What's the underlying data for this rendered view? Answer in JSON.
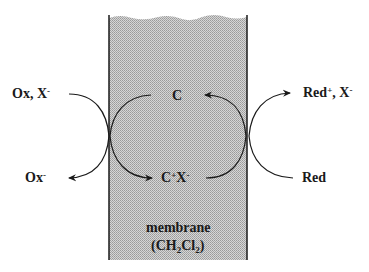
{
  "diagram": {
    "colors": {
      "membrane_fill": "#c8c8c8",
      "stroke": "#1a1a1a",
      "text": "#1a1a1a",
      "background": "#ffffff"
    },
    "left_side": {
      "top_species": {
        "main": "Ox, X",
        "charge": "-"
      },
      "bottom_species": {
        "main": "Ox",
        "charge": "-"
      }
    },
    "membrane": {
      "top_species": {
        "main": "C"
      },
      "bottom_species": {
        "main": "C",
        "charge1": "+",
        "mid": "X",
        "charge2": "-"
      },
      "label": "membrane",
      "solvent": {
        "open": "(CH",
        "sub1": "2",
        "mid": "Cl",
        "sub2": "2",
        "close": ")"
      }
    },
    "right_side": {
      "top_species": {
        "main": "Red",
        "charge1": "+",
        "mid": ", X",
        "charge2": "-"
      },
      "bottom_species": {
        "main": "Red"
      }
    }
  }
}
